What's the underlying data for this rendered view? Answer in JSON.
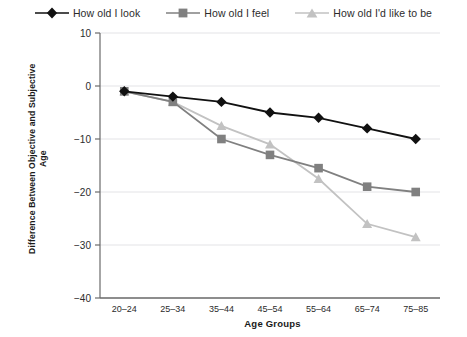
{
  "chart_data": {
    "type": "line",
    "title": "",
    "xlabel": "Age Groups",
    "ylabel": "Difference Between Objective and Subjective Age",
    "ylabel_line1": "Difference Between Objective and Subjective",
    "ylabel_line2": "Age",
    "categories": [
      "20–24",
      "25–34",
      "35–44",
      "45–54",
      "55–64",
      "65–74",
      "75–85"
    ],
    "ylim": [
      -40,
      10
    ],
    "yticks": [
      10,
      0,
      -10,
      -20,
      -30,
      -40
    ],
    "ytick_labels": [
      "10",
      "0",
      "−10",
      "−20",
      "−30",
      "−40"
    ],
    "grid": true,
    "legend_position": "top",
    "series": [
      {
        "name": "How old I look",
        "marker": "diamond",
        "color": "#111111",
        "values": [
          -1,
          -2,
          -3,
          -5,
          -6,
          -8,
          -10
        ]
      },
      {
        "name": "How old I feel",
        "marker": "square",
        "color": "#808080",
        "values": [
          -1,
          -3,
          -10,
          -13,
          -15.5,
          -19,
          -20
        ]
      },
      {
        "name": "How old I'd like to be",
        "marker": "triangle",
        "color": "#c2c2c2",
        "values": [
          -1,
          -3,
          -7.5,
          -11,
          -17.5,
          -26,
          -28.5
        ]
      }
    ]
  },
  "legend": {
    "items": [
      {
        "label": "How old I look",
        "icon": "diamond-marker-icon"
      },
      {
        "label": "How old I feel",
        "icon": "square-marker-icon"
      },
      {
        "label": "How old I'd like to be",
        "icon": "triangle-marker-icon"
      }
    ]
  },
  "colors": {
    "series_look": "#111111",
    "series_feel": "#808080",
    "series_like": "#c2c2c2",
    "axis": "#6b6b6b",
    "grid": "#e3e3e6",
    "text": "#2b2b2b"
  }
}
